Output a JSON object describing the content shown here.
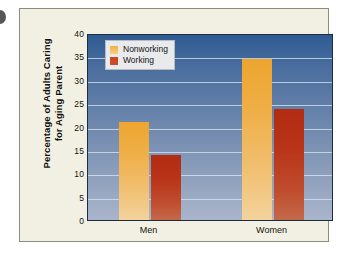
{
  "chart_data": {
    "type": "bar",
    "title": "",
    "xlabel": "",
    "ylabel": "Percentage of Adults Caring for Aging Parent",
    "ylabel_lines": [
      "Percentage of Adults Caring",
      "for Aging Parent"
    ],
    "categories": [
      "Men",
      "Women"
    ],
    "series": [
      {
        "name": "Nonworking",
        "values": [
          21,
          34.5
        ],
        "color": "#eda52f"
      },
      {
        "name": "Working",
        "values": [
          14,
          23.7
        ],
        "color": "#b22c13"
      }
    ],
    "ylim": [
      0,
      40
    ],
    "ytick_step": 5,
    "yticks": [
      "0",
      "5",
      "10",
      "15",
      "20",
      "25",
      "30",
      "35",
      "40"
    ],
    "grid": true,
    "legend_position": "top-left-inside",
    "plot_background_top_color": "#2f5b92",
    "plot_background_bottom_color": "#a9b5cb",
    "frame_background_color": "#f2f0e2"
  }
}
